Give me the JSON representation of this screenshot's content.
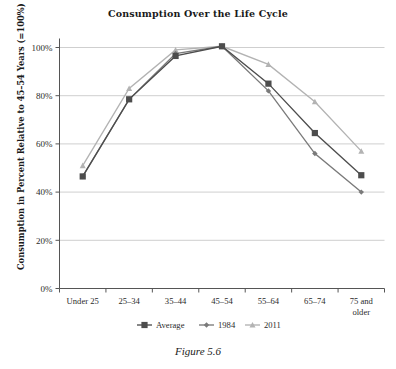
{
  "figure": {
    "caption": "Figure 5.6"
  },
  "chart_data": {
    "type": "line",
    "title": "Consumption Over the Life Cycle",
    "xlabel": "",
    "ylabel": "Consumption in Percent Relative to 45–54 Years (=100%)",
    "categories": [
      "Under 25",
      "25–34",
      "35–44",
      "45–54",
      "55–64",
      "65–74",
      "75 and older"
    ],
    "ylim": [
      0,
      100
    ],
    "yticks": [
      0,
      20,
      40,
      60,
      80,
      100
    ],
    "ytick_labels": [
      "0%",
      "20%",
      "40%",
      "60%",
      "80%",
      "100%"
    ],
    "grid": "horizontal",
    "legend_position": "bottom",
    "series": [
      {
        "name": "Average",
        "marker": "square",
        "color": "#4d4d4d",
        "values": [
          46.5,
          78.5,
          96.5,
          100.5,
          85.0,
          64.5,
          47.0
        ]
      },
      {
        "name": "1984",
        "marker": "diamond",
        "color": "#7a7a7a",
        "values": [
          46.5,
          78.5,
          97.5,
          100.5,
          82.0,
          56.0,
          40.0
        ]
      },
      {
        "name": "2011",
        "marker": "triangle",
        "color": "#b3b3b3",
        "values": [
          51.0,
          83.0,
          99.0,
          100.5,
          93.0,
          77.5,
          57.0
        ]
      }
    ]
  },
  "axis": {
    "tick_color": "#555555",
    "grid_color": "#c9c9c9",
    "axis_color": "#555555"
  },
  "xtick_labels_multiline": {
    "6": [
      "75 and",
      "older"
    ]
  }
}
